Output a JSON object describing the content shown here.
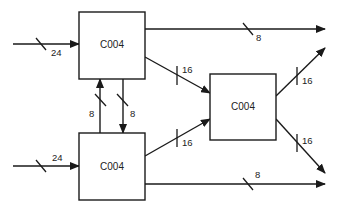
{
  "diagram": {
    "type": "block-diagram",
    "colors": {
      "line": "#1a1a1a",
      "background": "#ffffff",
      "text": "#222222"
    },
    "blocks": [
      {
        "id": "top-left",
        "label": "C004"
      },
      {
        "id": "bottom-left",
        "label": "C004"
      },
      {
        "id": "right",
        "label": "C004"
      }
    ],
    "buses": [
      {
        "id": "in-top",
        "from": "external",
        "to": "top-left",
        "width": "24"
      },
      {
        "id": "in-bottom",
        "from": "external",
        "to": "bottom-left",
        "width": "24"
      },
      {
        "id": "out-top",
        "from": "top-left",
        "to": "external",
        "width": "8"
      },
      {
        "id": "out-bottom",
        "from": "bottom-left",
        "to": "external",
        "width": "8"
      },
      {
        "id": "bl-to-tl",
        "from": "bottom-left",
        "to": "top-left",
        "width": "8"
      },
      {
        "id": "tl-to-bl",
        "from": "top-left",
        "to": "bottom-left",
        "width": "8"
      },
      {
        "id": "tl-to-r",
        "from": "top-left",
        "to": "right",
        "width": "16"
      },
      {
        "id": "bl-to-r",
        "from": "bottom-left",
        "to": "right",
        "width": "16"
      },
      {
        "id": "r-out-up",
        "from": "right",
        "to": "external",
        "width": "16"
      },
      {
        "id": "r-out-down",
        "from": "right",
        "to": "external",
        "width": "16"
      }
    ]
  }
}
